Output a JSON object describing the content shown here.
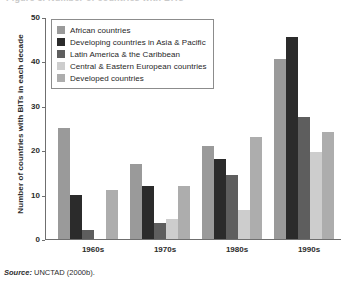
{
  "figure": {
    "clipped_title": "Figure 3. Number of countries with BITs",
    "source_prefix": "Source:",
    "source_text": "UNCTAD (2000b)."
  },
  "legend": {
    "position": "top-left-inside",
    "entries": [
      {
        "label": "African countries",
        "color": "#9a9a9a"
      },
      {
        "label": "Developing countries in Asia & Pacific",
        "color": "#2b2b2b"
      },
      {
        "label": "Latin America & the Caribbean",
        "color": "#5e5e5e"
      },
      {
        "label": "Central & Eastern European countries",
        "color": "#cdcdcd"
      },
      {
        "label": "Developed countries",
        "color": "#adadad"
      }
    ]
  },
  "chart_data": {
    "type": "bar",
    "title": "",
    "subtitle": "",
    "xlabel": "",
    "ylabel": "Number of countries with BITs in each decade",
    "ylim": [
      0,
      50
    ],
    "yticks": [
      0,
      10,
      20,
      30,
      40,
      50
    ],
    "grid": false,
    "categories": [
      "1960s",
      "1970s",
      "1980s",
      "1990s"
    ],
    "series": [
      {
        "name": "African countries",
        "color": "#9a9a9a",
        "values": [
          25,
          17,
          21,
          40.5
        ]
      },
      {
        "name": "Developing countries in Asia & Pacific",
        "color": "#2b2b2b",
        "values": [
          10,
          12,
          18,
          45.5
        ]
      },
      {
        "name": "Latin America & the Caribbean",
        "color": "#5e5e5e",
        "values": [
          2,
          3.5,
          14.5,
          27.5
        ]
      },
      {
        "name": "Central & Eastern European countries",
        "color": "#cdcdcd",
        "values": [
          0,
          4.5,
          6.5,
          19.5
        ]
      },
      {
        "name": "Developed countries",
        "color": "#adadad",
        "values": [
          11,
          12,
          23,
          24
        ]
      }
    ]
  }
}
